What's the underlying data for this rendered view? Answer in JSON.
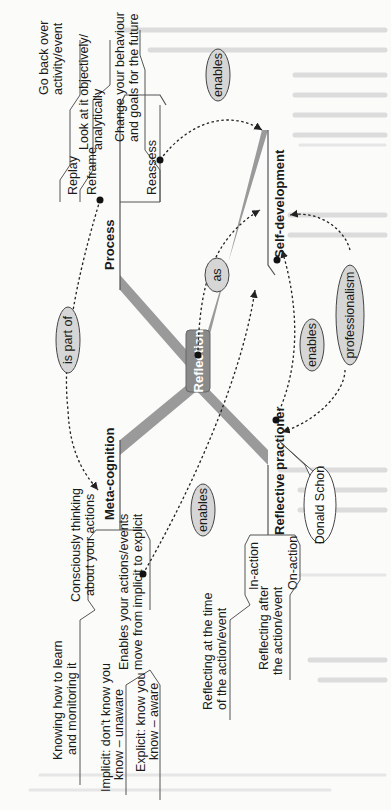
{
  "colors": {
    "root_fill": "#8a8a8a",
    "root_text": "#ffffff",
    "oval_fill": "#d6d6d6",
    "line": "#333333",
    "spoke": "#9a9a9a",
    "bg_text": "#d8d8d8"
  },
  "root": {
    "label": "Reflection"
  },
  "branches": {
    "process": {
      "label": "Process",
      "children": [
        {
          "label": "Replay",
          "desc": [
            "Go back over",
            "activity/event"
          ]
        },
        {
          "label": "Reframe",
          "desc": [
            "Look at it objectively/",
            "analytically"
          ]
        },
        {
          "label": "Reassess",
          "desc": [
            "Change your behaviour",
            "and goals for the future"
          ]
        }
      ]
    },
    "self_development": {
      "label": "Self-development"
    },
    "meta_cognition": {
      "label": "Meta-cognition",
      "children": [
        {
          "desc": [
            "Consciously thinking",
            "about your actions"
          ]
        },
        {
          "desc": [
            "Enables your actions/events",
            "move from implicit to explicit"
          ]
        }
      ],
      "sub_children": [
        {
          "desc": [
            "Knowing how to learn",
            "and monitoring it"
          ]
        },
        {
          "desc": [
            "Implicit: don't know you",
            "know – unaware"
          ]
        },
        {
          "desc": [
            "Explicit: know you",
            "know – aware"
          ]
        }
      ]
    },
    "reflective_practitioner": {
      "label": "Reflective practioner",
      "callout": "Donald Schon",
      "children": [
        {
          "label": "In-action",
          "desc": [
            "Reflecting at the time",
            "of the action/event"
          ]
        },
        {
          "label": "On-action",
          "desc": [
            "Reflecting after",
            "the action/event"
          ]
        }
      ]
    }
  },
  "links": [
    {
      "label": "is part of"
    },
    {
      "label": "enables"
    },
    {
      "label": "as"
    },
    {
      "label": "enables"
    },
    {
      "label": "enables"
    },
    {
      "label": "professionalism"
    }
  ]
}
